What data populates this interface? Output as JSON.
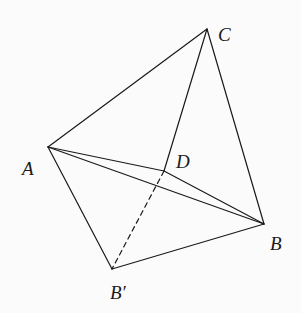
{
  "diagram": {
    "type": "geometry-folding",
    "points": {
      "A": {
        "label": "A",
        "x": 48,
        "y": 147,
        "label_x": 22,
        "label_y": 175
      },
      "C": {
        "label": "C",
        "x": 207,
        "y": 29,
        "label_x": 218,
        "label_y": 41
      },
      "D": {
        "label": "D",
        "x": 164,
        "y": 171,
        "label_x": 176,
        "label_y": 168
      },
      "B": {
        "label": "B",
        "x": 264,
        "y": 224,
        "label_x": 270,
        "label_y": 250
      },
      "Bp": {
        "label": "B′",
        "x": 112,
        "y": 269,
        "label_x": 110,
        "label_y": 299
      }
    },
    "edges": [
      {
        "from": "A",
        "to": "C",
        "style": "solid"
      },
      {
        "from": "C",
        "to": "D",
        "style": "solid"
      },
      {
        "from": "C",
        "to": "B",
        "style": "solid"
      },
      {
        "from": "A",
        "to": "D",
        "style": "solid"
      },
      {
        "from": "A",
        "to": "B",
        "style": "solid"
      },
      {
        "from": "D",
        "to": "B",
        "style": "solid"
      },
      {
        "from": "A",
        "to": "Bp",
        "style": "solid"
      },
      {
        "from": "Bp",
        "to": "B",
        "style": "solid"
      },
      {
        "from": "D",
        "to": "Bp",
        "style": "dashed"
      }
    ],
    "colors": {
      "line": "#1a1a1a",
      "background": "#fbfbfb"
    }
  }
}
